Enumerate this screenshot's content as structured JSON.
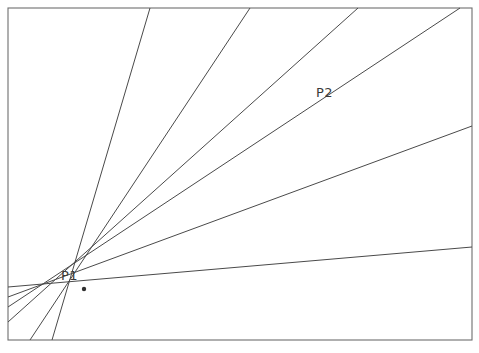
{
  "figure": {
    "type": "line-diagram",
    "title": "",
    "width": 479,
    "height": 353,
    "background_color": "#ffffff",
    "line_color": "#4a4a4a",
    "frame_color": "#6e6e6e",
    "label_color": "#3a3a3a"
  },
  "frame": {
    "x": 8,
    "y": 8,
    "width": 464,
    "height": 332
  },
  "points": [
    {
      "id": "P1",
      "label": "P1",
      "x": 84,
      "y": 289,
      "label_x": 61,
      "label_y": 269,
      "is_vertex": true
    },
    {
      "id": "P2",
      "label": "P2",
      "x": 345,
      "y": 104,
      "label_x": 316,
      "label_y": 86,
      "is_vertex": false
    }
  ],
  "rays": [
    {
      "id": "ray-1",
      "name": "steep-ray-leftmost",
      "x1": 52,
      "y1": 340,
      "x2": 150,
      "y2": 8
    },
    {
      "id": "ray-2",
      "name": "ray-to-top-left",
      "x1": 30,
      "y1": 340,
      "x2": 250,
      "y2": 8
    },
    {
      "id": "ray-3",
      "name": "ray-to-top-middle",
      "x1": 8,
      "y1": 322,
      "x2": 358,
      "y2": 8
    },
    {
      "id": "ray-4",
      "name": "ray-through-p2",
      "x1": 8,
      "y1": 307,
      "x2": 460,
      "y2": 8
    },
    {
      "id": "ray-5",
      "name": "ray-to-right-upper",
      "x1": 8,
      "y1": 297,
      "x2": 472,
      "y2": 126
    },
    {
      "id": "ray-6",
      "name": "ray-to-right-lower",
      "x1": 8,
      "y1": 287,
      "x2": 472,
      "y2": 247
    }
  ],
  "chart_data": {
    "type": "scatter",
    "title": "",
    "xlabel": "",
    "ylabel": "",
    "annotations": [
      "P1",
      "P2"
    ],
    "series": [
      {
        "name": "ray-1",
        "x": [
          52,
          150
        ],
        "y": [
          340,
          8
        ]
      },
      {
        "name": "ray-2",
        "x": [
          30,
          250
        ],
        "y": [
          340,
          8
        ]
      },
      {
        "name": "ray-3",
        "x": [
          8,
          358
        ],
        "y": [
          322,
          8
        ]
      },
      {
        "name": "ray-4",
        "x": [
          8,
          460
        ],
        "y": [
          307,
          8
        ]
      },
      {
        "name": "ray-5",
        "x": [
          8,
          472
        ],
        "y": [
          297,
          126
        ]
      },
      {
        "name": "ray-6",
        "x": [
          8,
          472
        ],
        "y": [
          287,
          247
        ]
      }
    ],
    "xlim": [
      0,
      479
    ],
    "ylim": [
      353,
      0
    ],
    "grid": false,
    "legend": false
  }
}
